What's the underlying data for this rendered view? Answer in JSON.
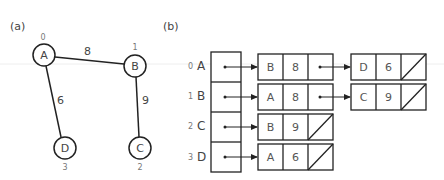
{
  "panels": {
    "a_label": "(a)",
    "b_label": "(b)"
  },
  "graph": {
    "nodes": [
      {
        "id": "A",
        "index": "0",
        "cx": 44,
        "cy": 55,
        "index_y": 40
      },
      {
        "id": "B",
        "index": "1",
        "cx": 135,
        "cy": 66,
        "index_y": 51
      },
      {
        "id": "C",
        "index": "2",
        "cx": 140,
        "cy": 148,
        "index_y": 170
      },
      {
        "id": "D",
        "index": "3",
        "cx": 65,
        "cy": 148,
        "index_y": 170
      }
    ],
    "edges": [
      {
        "from": "A",
        "to": "B",
        "weight": "8"
      },
      {
        "from": "A",
        "to": "D",
        "weight": "6"
      },
      {
        "from": "B",
        "to": "C",
        "weight": "9"
      }
    ]
  },
  "adjacency_list": {
    "rows": [
      {
        "index": "0",
        "vertex": "A",
        "list": [
          {
            "v": "B",
            "w": "8"
          },
          {
            "v": "D",
            "w": "6"
          }
        ]
      },
      {
        "index": "1",
        "vertex": "B",
        "list": [
          {
            "v": "A",
            "w": "8"
          },
          {
            "v": "C",
            "w": "9"
          }
        ]
      },
      {
        "index": "2",
        "vertex": "C",
        "list": [
          {
            "v": "B",
            "w": "9"
          }
        ]
      },
      {
        "index": "3",
        "vertex": "D",
        "list": [
          {
            "v": "A",
            "w": "6"
          }
        ]
      }
    ]
  }
}
